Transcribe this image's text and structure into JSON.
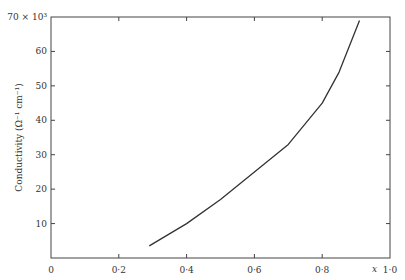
{
  "chart_data": {
    "type": "line",
    "title": "",
    "xlabel": "x",
    "ylabel": "Conductivity (Ω⁻¹ cm⁻¹)",
    "y_multiplier": "×10³",
    "xlim": [
      0,
      1.0
    ],
    "ylim": [
      0,
      70
    ],
    "x_ticks": [
      "0",
      "0·2",
      "0·4",
      "0·6",
      "0·8",
      "1·0"
    ],
    "y_ticks": [
      "10",
      "20",
      "30",
      "40",
      "50",
      "60",
      "70 × 10³"
    ],
    "grid": false,
    "series": [
      {
        "name": "conductivity",
        "x": [
          0.29,
          0.4,
          0.5,
          0.6,
          0.7,
          0.8,
          0.85,
          0.91
        ],
        "y": [
          3.5,
          10,
          17,
          25,
          33,
          45,
          54,
          69
        ]
      }
    ]
  }
}
